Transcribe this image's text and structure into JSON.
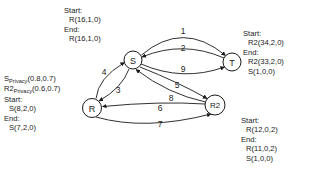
{
  "diagram": {
    "type": "state-transition-graph",
    "nodes": [
      {
        "id": "S",
        "label": "S",
        "cx": 133,
        "cy": 60,
        "r": 9
      },
      {
        "id": "T",
        "label": "T",
        "cx": 232,
        "cy": 62,
        "r": 9
      },
      {
        "id": "R",
        "label": "R",
        "cx": 92,
        "cy": 108,
        "r": 9.5
      },
      {
        "id": "R2",
        "label": "R2",
        "cx": 215,
        "cy": 105,
        "r": 10
      }
    ],
    "edges": [
      {
        "label": "1",
        "from": "S",
        "to": "T",
        "lx": 183,
        "ly": 31
      },
      {
        "label": "2",
        "from": "T",
        "to": "S",
        "lx": 183,
        "ly": 48
      },
      {
        "label": "9",
        "from": "S",
        "to": "T",
        "lx": 183,
        "ly": 69
      },
      {
        "label": "4",
        "from": "R",
        "to": "S",
        "lx": 104,
        "ly": 72
      },
      {
        "label": "3",
        "from": "S",
        "to": "R",
        "lx": 118,
        "ly": 90
      },
      {
        "label": "5",
        "from": "S",
        "to": "R2",
        "lx": 177,
        "ly": 85
      },
      {
        "label": "8",
        "from": "R2",
        "to": "S",
        "lx": 171,
        "ly": 98
      },
      {
        "label": "6",
        "from": "R2",
        "to": "R",
        "lx": 160,
        "ly": 108
      },
      {
        "label": "7",
        "from": "R",
        "to": "R2",
        "lx": 160,
        "ly": 124
      }
    ]
  },
  "annotations": {
    "top_left": {
      "start_label": "Start:",
      "start_value": "R(16,1,0)",
      "end_label": "End:",
      "end_value": "R(16,1,0)"
    },
    "top_right": {
      "start_label": "Start:",
      "start_value": "R2(34,2,0)",
      "end_label": "End:",
      "end_value_1": "R2(33,2,0)",
      "end_value_2": "S(1,0,0)"
    },
    "left": {
      "privacy_1_name": "S",
      "privacy_1_sub": "Privacy",
      "privacy_1_value": "(0.8,0.7)",
      "privacy_2_name": "R2",
      "privacy_2_sub": "Privacy",
      "privacy_2_value": "(0.6,0.7)",
      "start_label": "Start:",
      "start_value": "S(8,2,0)",
      "end_label": "End:",
      "end_value": "S(7,2,0)"
    },
    "bottom_right": {
      "start_label": "Start:",
      "start_value": "R(12,0,2)",
      "end_label": "End:",
      "end_value_1": "R(11,0,2)",
      "end_value_2": "S(1,0,0)"
    }
  },
  "colors": {
    "stroke": "#1a1a1a",
    "background": "#ffffff"
  }
}
